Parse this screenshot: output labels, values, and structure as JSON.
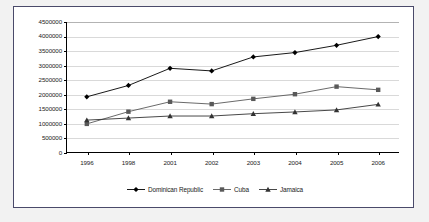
{
  "chart_data": {
    "type": "line",
    "title": "",
    "xlabel": "",
    "ylabel": "",
    "categories": [
      "1996",
      "1998",
      "2001",
      "2002",
      "2003",
      "2004",
      "2005",
      "2006"
    ],
    "ylim": [
      0,
      4500000
    ],
    "ytick_step": 500000,
    "yticks": [
      "0",
      "500000",
      "1000000",
      "1500000",
      "2000000",
      "2500000",
      "3000000",
      "3500000",
      "4000000",
      "4500000"
    ],
    "grid": true,
    "legend_position": "bottom",
    "series": [
      {
        "name": "Dominican Republic",
        "marker": "diamond",
        "color": "#000000",
        "values": [
          1930000,
          2320000,
          2910000,
          2820000,
          3300000,
          3450000,
          3700000,
          4000000
        ]
      },
      {
        "name": "Cuba",
        "marker": "square",
        "color": "#595959",
        "values": [
          1000000,
          1420000,
          1760000,
          1680000,
          1860000,
          2020000,
          2280000,
          2170000
        ]
      },
      {
        "name": "Jamaica",
        "marker": "triangle",
        "color": "#333333",
        "values": [
          1130000,
          1200000,
          1270000,
          1270000,
          1350000,
          1410000,
          1480000,
          1670000
        ]
      }
    ]
  },
  "style": {
    "plot_border_color": "#000000",
    "gridline_color": "#d9d9d9",
    "frame_border_color": "#4a4a6a",
    "background": "#ffffff",
    "page_backdrop": "#f2f2f2"
  }
}
